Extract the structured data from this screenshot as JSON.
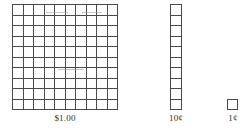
{
  "diagram": {
    "background_color": "#ffffff",
    "line_color": "#4a4a4a",
    "text_color": "#2f2f2f",
    "blocks": [
      {
        "name": "hundred-flat",
        "label": "$1.00",
        "columns": 10,
        "rows": 10,
        "cell_count": 100
      },
      {
        "name": "ten-rod",
        "label": "10¢",
        "columns": 1,
        "rows": 10,
        "cell_count": 10
      },
      {
        "name": "one-unit",
        "label": "1¢",
        "columns": 1,
        "rows": 1,
        "cell_count": 1
      }
    ]
  }
}
